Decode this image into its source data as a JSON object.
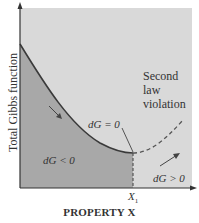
{
  "diagram": {
    "y_axis_label": "Total Gibbs function",
    "x_axis_label": "PROPERTY X",
    "x_marker": {
      "symbol": "X",
      "subscript": "1"
    },
    "region_labels": {
      "left": "dG < 0",
      "equilibrium": "dG = 0",
      "right": "dG > 0"
    },
    "annotation": {
      "line1": "Second",
      "line2": "law",
      "line3": "violation"
    },
    "colors": {
      "background": "#d9d9d9",
      "shaded_region": "#a8a8a8",
      "curve": "#3a3a3a",
      "dashed": "#555555"
    }
  }
}
